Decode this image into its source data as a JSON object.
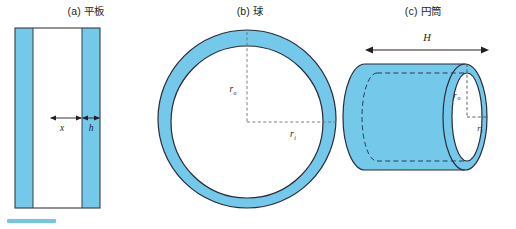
{
  "figure": {
    "title_a": "(a) 平板",
    "title_b": "(b) 球",
    "title_c": "(c) 円筒",
    "colors": {
      "fill": "#74c8ea",
      "fill_light": "#8ed4ef",
      "outline": "#2b2b3a",
      "text": "#231f20",
      "swatch": "#6ec6e8"
    }
  },
  "panel_a": {
    "name": "平板",
    "label_x": "x",
    "label_h": "h"
  },
  "panel_b": {
    "name": "球",
    "label_ro": "r",
    "label_ro_sub": "o",
    "label_ri": "r",
    "label_ri_sub": "i"
  },
  "panel_c": {
    "name": "円筒",
    "label_H": "H",
    "label_ro": "r",
    "label_ro_sub": "o",
    "label_ri": "r",
    "label_ri_sub": "i"
  }
}
